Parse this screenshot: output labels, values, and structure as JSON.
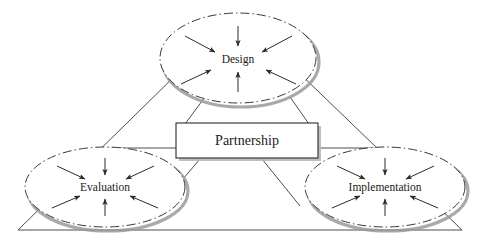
{
  "diagram": {
    "type": "triangular-relationship-diagram",
    "center": {
      "label": "Partnership",
      "shape": "rectangle",
      "x": 247,
      "y": 141,
      "width": 142,
      "height": 35,
      "border_color": "#2b2b2b",
      "fill_color": "#ffffff"
    },
    "nodes": [
      {
        "id": "design",
        "label": "Design",
        "shape": "ellipse",
        "position": "top",
        "cx": 238,
        "cy": 58,
        "rx": 78,
        "ry": 45,
        "inbound_arrows": 6,
        "border_style": "dash-dot",
        "border_color": "#3a3a3a",
        "shadow_color": "#9a9a9a"
      },
      {
        "id": "evaluation",
        "label": "Evaluation",
        "shape": "ellipse",
        "position": "bottom-left",
        "cx": 105,
        "cy": 187,
        "rx": 80,
        "ry": 40,
        "inbound_arrows": 6,
        "border_style": "dash-dot",
        "border_color": "#3a3a3a",
        "shadow_color": "#9a9a9a"
      },
      {
        "id": "implementation",
        "label": "Implementation",
        "shape": "ellipse",
        "position": "bottom-right",
        "cx": 385,
        "cy": 187,
        "rx": 80,
        "ry": 40,
        "inbound_arrows": 6,
        "border_style": "dash-dot",
        "border_color": "#3a3a3a",
        "shadow_color": "#9a9a9a"
      }
    ],
    "triangle": {
      "apex": {
        "x": 238,
        "y": 14
      },
      "bottom_left": {
        "x": 18,
        "y": 230
      },
      "bottom_right": {
        "x": 462,
        "y": 230
      },
      "stroke_color": "#3a3a3a"
    },
    "connectors": [
      {
        "from": "partnership",
        "to": "design",
        "style": "line"
      },
      {
        "from": "partnership",
        "to": "design",
        "style": "line"
      },
      {
        "from": "partnership",
        "to": "evaluation",
        "style": "line"
      },
      {
        "from": "partnership",
        "to": "evaluation",
        "style": "line"
      },
      {
        "from": "partnership",
        "to": "implementation",
        "style": "line"
      },
      {
        "from": "partnership",
        "to": "implementation",
        "style": "line"
      }
    ],
    "colors": {
      "background": "#ffffff",
      "line": "#3a3a3a",
      "text": "#1a1a1a",
      "shadow": "#9a9a9a"
    }
  }
}
